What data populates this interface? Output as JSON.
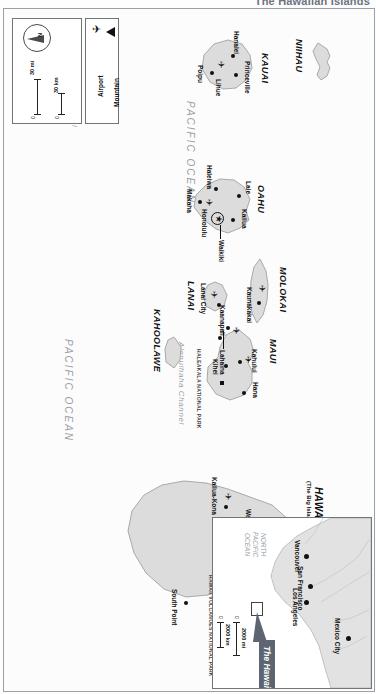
{
  "page": {
    "title": "The Hawaiian Islands"
  },
  "legend": {
    "compass_label": "N",
    "scales": [
      {
        "unit": "30 mi",
        "min": "0",
        "max": "30"
      },
      {
        "unit": "30 km",
        "min": "0",
        "max": "30"
      }
    ],
    "key_items": [
      {
        "icon": "airport-icon",
        "label": "Airport",
        "glyph": "✈"
      },
      {
        "icon": "mountain-icon",
        "label": "Mountain",
        "glyph": "▲"
      }
    ]
  },
  "ocean_labels": [
    {
      "name": "PACIFIC OCEAN"
    },
    {
      "name": "PACIFIC OCEAN"
    }
  ],
  "channels": [
    {
      "name": "Kauai Channel"
    },
    {
      "name": "Alenuihaha Channel"
    }
  ],
  "parks": [
    {
      "name": "HALEAKALA NATIONAL PARK"
    },
    {
      "name": "HAWAII VOLCANOES NATIONAL PARK"
    }
  ],
  "islands": [
    {
      "name": "NIIHAU",
      "subtitle": ""
    },
    {
      "name": "KAUAI",
      "subtitle": ""
    },
    {
      "name": "OAHU",
      "subtitle": ""
    },
    {
      "name": "MOLOKAI",
      "subtitle": ""
    },
    {
      "name": "LANAI",
      "subtitle": ""
    },
    {
      "name": "MAUI",
      "subtitle": ""
    },
    {
      "name": "KAHOOLAWE",
      "subtitle": ""
    },
    {
      "name": "HAWAII",
      "subtitle": "(The Big Island)"
    }
  ],
  "places": [
    {
      "name": "Hanalei",
      "island": "KAUAI",
      "marker": "dot"
    },
    {
      "name": "Princeville",
      "island": "KAUAI",
      "marker": "dot"
    },
    {
      "name": "Lihue",
      "island": "KAUAI",
      "marker": "airport"
    },
    {
      "name": "Poipu",
      "island": "KAUAI",
      "marker": "dot"
    },
    {
      "name": "Laie",
      "island": "OAHU",
      "marker": "dot"
    },
    {
      "name": "Haleiwa",
      "island": "OAHU",
      "marker": "dot"
    },
    {
      "name": "Makaha",
      "island": "OAHU",
      "marker": "dot"
    },
    {
      "name": "Kailua",
      "island": "OAHU",
      "marker": "dot"
    },
    {
      "name": "Waikiki",
      "island": "OAHU",
      "marker": "line"
    },
    {
      "name": "Honolulu",
      "island": "OAHU",
      "marker": "capital-airport"
    },
    {
      "name": "Kaunakakai",
      "island": "MOLOKAI",
      "marker": "airport"
    },
    {
      "name": "Lanai City",
      "island": "LANAI",
      "marker": "airport"
    },
    {
      "name": "Kaanapali",
      "island": "MAUI",
      "marker": "airport"
    },
    {
      "name": "Lahaina",
      "island": "MAUI",
      "marker": "dot"
    },
    {
      "name": "Kahului",
      "island": "MAUI",
      "marker": "airport"
    },
    {
      "name": "Kihei",
      "island": "MAUI",
      "marker": "dot"
    },
    {
      "name": "Hana",
      "island": "MAUI",
      "marker": "dot"
    },
    {
      "name": "Hilo",
      "island": "HAWAII",
      "marker": "airport"
    },
    {
      "name": "Waimea",
      "island": "HAWAII",
      "marker": "dot"
    },
    {
      "name": "Kailua-Kona",
      "island": "HAWAII",
      "marker": "airport"
    },
    {
      "name": "South Point",
      "island": "HAWAII",
      "marker": "dot"
    }
  ],
  "summits": [
    {
      "name": "Mauna Kea",
      "marker": "mountain"
    },
    {
      "name": "Mauna Loa",
      "marker": "mountain"
    },
    {
      "name": "Kilauea Iki Crater",
      "marker": "square"
    }
  ],
  "inset": {
    "callout": "The Hawaiian Islands",
    "ocean": "NORTH PACIFIC OCEAN",
    "ocean_lines": [
      "NORTH",
      "PACIFIC",
      "OCEAN"
    ],
    "cities": [
      {
        "name": "Vancouver"
      },
      {
        "name": "San Francisco"
      },
      {
        "name": "Los Angeles"
      },
      {
        "name": "Mexico City"
      }
    ],
    "scales": [
      {
        "unit": "2000 mi",
        "min": "0"
      },
      {
        "unit": "2000 km",
        "min": "0"
      }
    ]
  },
  "colors": {
    "land": "#dcdcdc",
    "land_stroke": "#a9a9a9",
    "sea_text": "#9aa1a8",
    "callout_bg": "#5d6670",
    "frame": "#9aa0a6"
  }
}
